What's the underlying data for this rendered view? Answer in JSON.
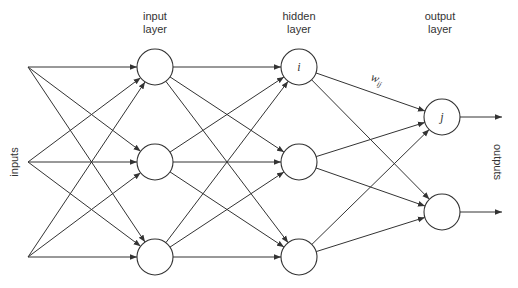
{
  "diagram": {
    "layer_labels": {
      "input": [
        "input",
        "layer"
      ],
      "hidden": [
        "hidden",
        "layer"
      ],
      "output": [
        "output",
        "layer"
      ]
    },
    "side_labels": {
      "inputs": "inputs",
      "outputs": "outputs"
    },
    "node_labels": {
      "hidden_i": "i",
      "output_j": "j"
    },
    "weight_label": {
      "base": "w",
      "subscript": "ij"
    },
    "colors": {
      "stroke": "#333333",
      "background": "#ffffff"
    },
    "nodes": {
      "sources": [
        {
          "x": 28,
          "y": 67
        },
        {
          "x": 28,
          "y": 162
        },
        {
          "x": 28,
          "y": 257
        }
      ],
      "input": [
        {
          "x": 155,
          "y": 67
        },
        {
          "x": 155,
          "y": 162
        },
        {
          "x": 155,
          "y": 257
        }
      ],
      "hidden": [
        {
          "x": 299,
          "y": 67
        },
        {
          "x": 299,
          "y": 162
        },
        {
          "x": 299,
          "y": 257
        }
      ],
      "output": [
        {
          "x": 442,
          "y": 117
        },
        {
          "x": 442,
          "y": 212
        }
      ]
    },
    "node_radius": 18
  }
}
